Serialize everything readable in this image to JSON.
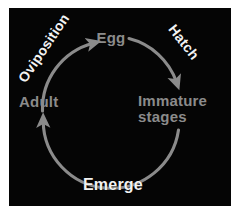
{
  "diagram": {
    "type": "cycle-diagram",
    "background_color": "#050505",
    "page_background_color": "#ffffff",
    "arrow_color": "#8b8b8b",
    "stage_label_color": "#8b8b8b",
    "process_label_color": "#f2f2f2",
    "direction": "clockwise",
    "stages": [
      {
        "id": "egg",
        "label": "Egg",
        "position": "top"
      },
      {
        "id": "immature",
        "label": "Immature\nstages",
        "position": "right"
      },
      {
        "id": "adult",
        "label": "Adult",
        "position": "left"
      }
    ],
    "processes": [
      {
        "id": "oviposition",
        "label": "Oviposition",
        "position": "top-left",
        "rotation_deg": -56
      },
      {
        "id": "hatch",
        "label": "Hatch",
        "position": "top-right",
        "rotation_deg": 52
      },
      {
        "id": "emerge",
        "label": "Emerge",
        "position": "bottom",
        "rotation_deg": 0
      }
    ]
  }
}
